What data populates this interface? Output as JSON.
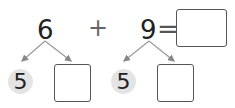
{
  "problem": {
    "addend1": "6",
    "operator": "+",
    "addend2": "9",
    "equals": "=",
    "answer": ""
  },
  "decomposition": {
    "left": {
      "given": "5",
      "blank": ""
    },
    "right": {
      "given": "5",
      "blank": ""
    }
  },
  "colors": {
    "circle_fill": "#e4e4e4",
    "line": "#888888",
    "box_border": "#555555"
  }
}
